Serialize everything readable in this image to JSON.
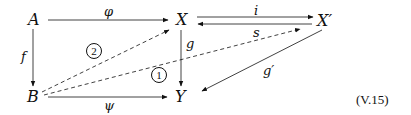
{
  "diagram": {
    "type": "commutative-diagram",
    "equation_label": "(V.15)",
    "nodes": {
      "A": "A",
      "B": "B",
      "X": "X",
      "Y": "Y",
      "Xp": "X′"
    },
    "arrows": {
      "phi": {
        "from": "A",
        "to": "X",
        "label": "φ",
        "style": "solid"
      },
      "f": {
        "from": "A",
        "to": "B",
        "label": "f",
        "style": "solid"
      },
      "g": {
        "from": "X",
        "to": "Y",
        "label": "g",
        "style": "solid"
      },
      "psi": {
        "from": "B",
        "to": "Y",
        "label": "ψ",
        "style": "solid"
      },
      "i": {
        "from": "X",
        "to": "X′",
        "label": "i",
        "style": "solid"
      },
      "s": {
        "from": "X′",
        "to": "X",
        "label": "s",
        "style": "solid"
      },
      "gp": {
        "from": "X′",
        "to": "Y",
        "label": "g′",
        "style": "solid"
      },
      "dashed_BX": {
        "from": "B",
        "to": "X",
        "label": "",
        "style": "dashed"
      },
      "dashed_BXp": {
        "from": "B",
        "to": "X′",
        "label": "",
        "style": "dashed"
      }
    },
    "regions": {
      "one": "1",
      "two": "2"
    }
  }
}
